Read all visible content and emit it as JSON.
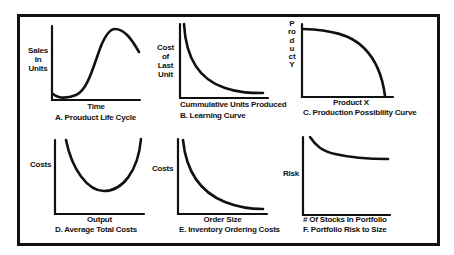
{
  "figure": {
    "border_color": "#111111",
    "panels": [
      {
        "id": "A",
        "title": "A.  Prouduct Life Cycle",
        "ylabel_lines": [
          "Sales",
          "In",
          "Units"
        ],
        "xlabel": "Time",
        "curve": "S-curve rising to peak then declining",
        "axes": {
          "origin": [
            52,
            100
          ],
          "y_top": 26,
          "x_right": 140
        },
        "path": "M53,94 C58,98 66,99 76,95 C88,90 94,64 101,46 C106,34 110,29 115,29 C124,29 131,38 139,52"
      },
      {
        "id": "B",
        "title": "B.  Learning Curve",
        "ylabel_lines": [
          "Cost",
          "of",
          "Last",
          "Unit"
        ],
        "xlabel": "Cummulative Units Produced",
        "curve": "decaying curve (inverse)",
        "axes": {
          "origin": [
            180,
            98
          ],
          "y_top": 24,
          "x_right": 268
        },
        "path": "M184,24 C186,60 200,80 225,88 C240,93 250,93 263,93"
      },
      {
        "id": "C",
        "title": "C.  Production Possibility Curve",
        "ylabel": "Product Y",
        "xlabel": "Product X",
        "curve": "concave frontier",
        "axes": {
          "origin": [
            302,
            97
          ],
          "y_top": 24,
          "x_right": 393
        },
        "path": "M303,29 C330,30 350,34 364,48 C378,62 383,80 385,96"
      },
      {
        "id": "D",
        "title": "D.  Average Total Costs",
        "ylabel": "Costs",
        "xlabel": "Output",
        "curve": "U-shaped",
        "axes": {
          "origin": [
            55,
            214
          ],
          "y_top": 140,
          "x_right": 144
        },
        "path": "M66,140 C72,170 88,191 104,191 C122,191 138,172 141,139"
      },
      {
        "id": "E",
        "title": "E.  Inventory Ordering Costs",
        "ylabel": "Costs",
        "xlabel": "Order Size",
        "curve": "decaying curve",
        "axes": {
          "origin": [
            178,
            214
          ],
          "y_top": 139,
          "x_right": 267
        },
        "path": "M183,140 C186,170 200,192 225,202 C240,208 252,209 263,209"
      },
      {
        "id": "F",
        "title": "F.  Portfolio Risk to Size",
        "ylabel": "Risk",
        "xlabel": "# Of Stocks In Portfolio",
        "curve": "declining, leveling off",
        "axes": {
          "origin": [
            303,
            215
          ],
          "y_top": 137,
          "x_right": 390
        },
        "path": "M310,137 C316,146 322,151 335,154 C352,158 370,159 388,159"
      }
    ]
  }
}
